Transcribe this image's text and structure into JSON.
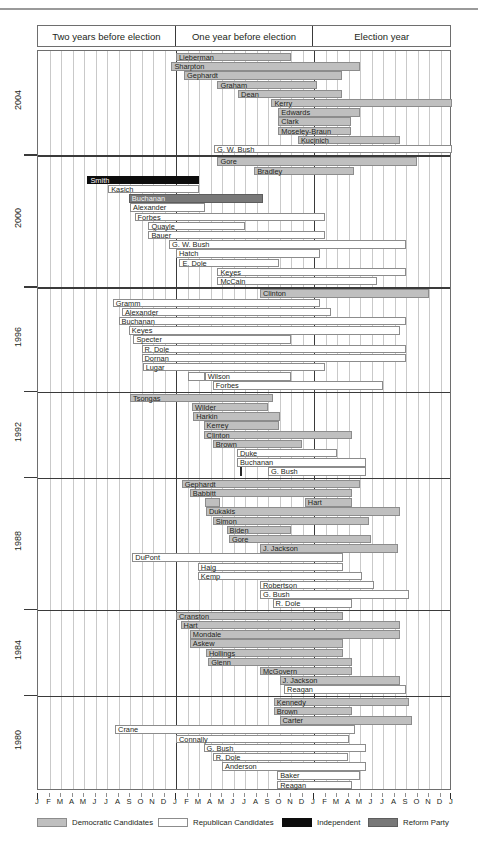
{
  "chart_data": {
    "type": "bar",
    "subtype": "gantt-timeline",
    "title": "",
    "xlabel": "",
    "ylabel": "",
    "grid": true,
    "legend_position": "bottom",
    "x_axis": {
      "unit": "month",
      "months": 36,
      "tick_labels": [
        "J",
        "F",
        "M",
        "A",
        "M",
        "J",
        "J",
        "A",
        "S",
        "O",
        "N",
        "D",
        "J",
        "F",
        "M",
        "A",
        "M",
        "J",
        "J",
        "A",
        "S",
        "O",
        "N",
        "D",
        "J",
        "F",
        "M",
        "A",
        "M",
        "J",
        "J",
        "A",
        "S",
        "O",
        "N",
        "D",
        "J"
      ],
      "heavy_ticks_at": [
        0,
        12,
        24,
        36
      ],
      "era_headers": [
        "Two years before election",
        "One year before election",
        "Election year"
      ]
    },
    "categories": [
      "2004",
      "2000",
      "1996",
      "1992",
      "1988",
      "1984",
      "1980"
    ],
    "party_colors": {
      "democratic": "#bfbfbf",
      "republican": "#ffffff",
      "independent": "#0d0d0d",
      "reform": "#787878"
    },
    "cycles": [
      {
        "year": "2004",
        "rows": [
          {
            "name": "Lieberman",
            "party": "dem",
            "start": 12.0,
            "end": 22.0,
            "segments": [
              {
                "start": 12.0,
                "end": 13.0
              }
            ]
          },
          {
            "name": "Sharpton",
            "party": "dem",
            "start": 11.6,
            "end": 28.0
          },
          {
            "name": "Gephardt",
            "party": "dem",
            "start": 12.7,
            "end": 26.4
          },
          {
            "name": "Graham",
            "party": "dem",
            "start": 15.6,
            "end": 24.3
          },
          {
            "name": "Dean",
            "party": "dem",
            "start": 17.4,
            "end": 26.4
          },
          {
            "name": "Kerry",
            "party": "dem",
            "start": 20.3,
            "end": 36.0
          },
          {
            "name": "Edwards",
            "party": "dem",
            "start": 20.9,
            "end": 28.0
          },
          {
            "name": "Clark",
            "party": "dem",
            "start": 20.9,
            "end": 27.2
          },
          {
            "name": "Moseley-Braun",
            "party": "dem",
            "start": 20.9,
            "end": 27.2
          },
          {
            "name": "Kucinich",
            "party": "dem",
            "start": 22.6,
            "end": 31.5
          },
          {
            "name": "G. W. Bush",
            "party": "rep",
            "start": 15.3,
            "end": 36.0
          }
        ]
      },
      {
        "year": "2000",
        "rows": [
          {
            "name": "Gore",
            "party": "dem",
            "start": 15.6,
            "end": 33.0
          },
          {
            "name": "Bradley",
            "party": "dem",
            "start": 18.8,
            "end": 27.5
          },
          {
            "name": "Smith",
            "party": "ind",
            "start": 4.3,
            "end": 14.0
          },
          {
            "name": "Kasich",
            "party": "rep",
            "start": 6.1,
            "end": 14.0
          },
          {
            "name": "Buchanan",
            "party": "ref",
            "start": 7.9,
            "end": 19.6
          },
          {
            "name": "Alexander",
            "party": "rep",
            "start": 8.0,
            "end": 14.5
          },
          {
            "name": "Forbes",
            "party": "rep",
            "start": 8.4,
            "end": 25.0
          },
          {
            "name": "Quayle",
            "party": "rep",
            "start": 9.6,
            "end": 18.0
          },
          {
            "name": "Bauer",
            "party": "rep",
            "start": 9.6,
            "end": 25.0
          },
          {
            "name": "G. W. Bush",
            "party": "rep",
            "start": 11.4,
            "end": 32.0
          },
          {
            "name": "Hatch",
            "party": "rep",
            "start": 12.0,
            "end": 24.5
          },
          {
            "name": "E. Dole",
            "party": "rep",
            "start": 12.3,
            "end": 21.0
          },
          {
            "name": "Keyes",
            "party": "rep",
            "start": 15.6,
            "end": 32.0
          },
          {
            "name": "McCain",
            "party": "rep",
            "start": 15.6,
            "end": 29.5
          }
        ]
      },
      {
        "year": "1996",
        "rows": [
          {
            "name": "Clinton",
            "party": "dem",
            "start": 19.3,
            "end": 34.0
          },
          {
            "name": "Gramm",
            "party": "rep",
            "start": 6.5,
            "end": 24.5
          },
          {
            "name": "Alexander",
            "party": "rep",
            "start": 7.3,
            "end": 25.5
          },
          {
            "name": "Buchanan",
            "party": "rep",
            "start": 7.0,
            "end": 32.0
          },
          {
            "name": "Keyes",
            "party": "rep",
            "start": 7.9,
            "end": 31.5
          },
          {
            "name": "Specter",
            "party": "rep",
            "start": 8.3,
            "end": 22.0
          },
          {
            "name": "R. Dole",
            "party": "rep",
            "start": 9.0,
            "end": 32.0
          },
          {
            "name": "Dornan",
            "party": "rep",
            "start": 9.0,
            "end": 32.0
          },
          {
            "name": "Lugar",
            "party": "rep",
            "start": 9.1,
            "end": 25.0
          },
          {
            "name": "Wilson",
            "party": "rep",
            "start": 14.5,
            "end": 22.0,
            "segments": [
              {
                "start": 13.0,
                "end": 14.5
              }
            ]
          },
          {
            "name": "Forbes",
            "party": "rep",
            "start": 15.2,
            "end": 30.0
          }
        ]
      },
      {
        "year": "1992",
        "rows": [
          {
            "name": "Tsongas",
            "party": "dem",
            "start": 8.0,
            "end": 20.4
          },
          {
            "name": "Wilder",
            "party": "dem",
            "start": 13.4,
            "end": 20.0
          },
          {
            "name": "Harkin",
            "party": "dem",
            "start": 13.5,
            "end": 21.0
          },
          {
            "name": "Kerrey",
            "party": "dem",
            "start": 14.4,
            "end": 21.0
          },
          {
            "name": "Clinton",
            "party": "dem",
            "start": 14.4,
            "end": 27.3
          },
          {
            "name": "Brown",
            "party": "dem",
            "start": 15.2,
            "end": 23.0
          },
          {
            "name": "Duke",
            "party": "rep",
            "start": 17.3,
            "end": 26.0
          },
          {
            "name": "Buchanan",
            "party": "rep",
            "start": 17.3,
            "end": 28.5
          },
          {
            "name": "G. Bush",
            "party": "rep",
            "start": 20.0,
            "end": 28.5,
            "tick_at": 17.6
          }
        ]
      },
      {
        "year": "1988",
        "rows": [
          {
            "name": "Gephardt",
            "party": "dem",
            "start": 12.5,
            "end": 28.0
          },
          {
            "name": "Babbitt",
            "party": "dem",
            "start": 13.2,
            "end": 27.3
          },
          {
            "name": "Hart",
            "party": "dem",
            "start": 23.2,
            "end": 27.3,
            "segments": [
              {
                "start": 14.5,
                "end": 15.8
              }
            ]
          },
          {
            "name": "Dukakis",
            "party": "dem",
            "start": 14.6,
            "end": 31.5
          },
          {
            "name": "Simon",
            "party": "dem",
            "start": 15.2,
            "end": 28.8
          },
          {
            "name": "Biden",
            "party": "dem",
            "start": 16.4,
            "end": 22.0
          },
          {
            "name": "Gore",
            "party": "dem",
            "start": 16.6,
            "end": 29.0
          },
          {
            "name": "J. Jackson",
            "party": "dem",
            "start": 19.3,
            "end": 31.3
          },
          {
            "name": "DuPont",
            "party": "rep",
            "start": 8.2,
            "end": 26.5
          },
          {
            "name": "Haig",
            "party": "rep",
            "start": 13.9,
            "end": 26.5
          },
          {
            "name": "Kemp",
            "party": "rep",
            "start": 13.9,
            "end": 28.2
          },
          {
            "name": "Robertson",
            "party": "rep",
            "start": 19.3,
            "end": 29.2
          },
          {
            "name": "G. Bush",
            "party": "rep",
            "start": 19.3,
            "end": 32.3
          },
          {
            "name": "R. Dole",
            "party": "rep",
            "start": 20.4,
            "end": 27.3
          }
        ]
      },
      {
        "year": "1984",
        "rows": [
          {
            "name": "Cranston",
            "party": "dem",
            "start": 12.0,
            "end": 26.5
          },
          {
            "name": "Hart",
            "party": "dem",
            "start": 12.4,
            "end": 31.5
          },
          {
            "name": "Mondale",
            "party": "dem",
            "start": 13.2,
            "end": 31.5
          },
          {
            "name": "Askew",
            "party": "dem",
            "start": 13.2,
            "end": 26.5
          },
          {
            "name": "Hollings",
            "party": "dem",
            "start": 14.6,
            "end": 26.5
          },
          {
            "name": "Glenn",
            "party": "dem",
            "start": 14.8,
            "end": 27.3
          },
          {
            "name": "McGovern",
            "party": "dem",
            "start": 19.3,
            "end": 27.3
          },
          {
            "name": "J. Jackson",
            "party": "dem",
            "start": 21.0,
            "end": 31.5
          },
          {
            "name": "Reagan",
            "party": "rep",
            "start": 21.4,
            "end": 32.0
          }
        ]
      },
      {
        "year": "1980",
        "rows": [
          {
            "name": "Kennedy",
            "party": "dem",
            "start": 20.5,
            "end": 32.3
          },
          {
            "name": "Brown",
            "party": "dem",
            "start": 20.5,
            "end": 27.3
          },
          {
            "name": "Carter",
            "party": "dem",
            "start": 21.0,
            "end": 32.5
          },
          {
            "name": "Crane",
            "party": "rep",
            "start": 6.7,
            "end": 27.6
          },
          {
            "name": "Connally",
            "party": "rep",
            "start": 12.0,
            "end": 27.0
          },
          {
            "name": "G. Bush",
            "party": "rep",
            "start": 14.4,
            "end": 28.5
          },
          {
            "name": "R. Dole",
            "party": "rep",
            "start": 15.2,
            "end": 27.0
          },
          {
            "name": "Anderson",
            "party": "rep",
            "start": 16.0,
            "end": 28.5
          },
          {
            "name": "Baker",
            "party": "rep",
            "start": 20.8,
            "end": 28.0
          },
          {
            "name": "Reagan",
            "party": "rep",
            "start": 20.8,
            "end": 27.3
          }
        ]
      }
    ],
    "legend": [
      {
        "key": "dem",
        "label": "Democratic Candidates"
      },
      {
        "key": "rep",
        "label": "Republican Candidates"
      },
      {
        "key": "ind",
        "label": "Independent"
      },
      {
        "key": "ref",
        "label": "Reform Party"
      }
    ]
  }
}
